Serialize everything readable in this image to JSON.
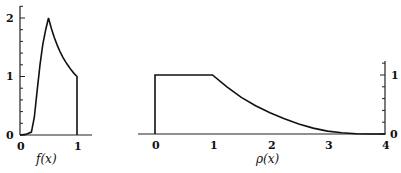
{
  "chart_data": [
    {
      "type": "line",
      "title": "",
      "xlabel": "f(x)",
      "ylabel": "",
      "xlim": [
        0,
        1.2
      ],
      "ylim": [
        0,
        2.2
      ],
      "grid": false,
      "legend": null,
      "y_axis_position": "left",
      "x_ticks": [
        0,
        1
      ],
      "x_tick_labels": [
        "0",
        "1"
      ],
      "y_ticks": [
        0,
        1,
        2
      ],
      "y_tick_labels": [
        "0",
        "1",
        "2"
      ],
      "y_minor_tick_step": 0.2,
      "series": [
        {
          "name": "f(x)",
          "x": [
            0,
            0.1,
            0.2,
            0.25,
            0.3,
            0.35,
            0.4,
            0.45,
            0.5,
            0.55,
            0.6,
            0.65,
            0.7,
            0.75,
            0.8,
            0.85,
            0.9,
            0.95,
            1.0,
            1.0
          ],
          "values": [
            0,
            0.01,
            0.05,
            0.3,
            0.75,
            1.2,
            1.55,
            1.8,
            2.0,
            1.82,
            1.67,
            1.54,
            1.43,
            1.33,
            1.25,
            1.18,
            1.11,
            1.05,
            1.0,
            0
          ]
        }
      ]
    },
    {
      "type": "line",
      "title": "",
      "xlabel": "ρ(x)",
      "ylabel": "",
      "xlim": [
        -0.25,
        4
      ],
      "ylim": [
        0,
        1.2
      ],
      "grid": false,
      "legend": null,
      "y_axis_position": "right",
      "x_ticks": [
        0,
        1,
        2,
        3,
        4
      ],
      "x_tick_labels": [
        "0",
        "1",
        "2",
        "3",
        "4"
      ],
      "y_ticks": [
        0,
        1
      ],
      "y_tick_labels": [
        "0",
        "1"
      ],
      "y_minor_tick_step": 0.2,
      "series": [
        {
          "name": "ρ(x)",
          "x": [
            0,
            0,
            1,
            1.25,
            1.5,
            1.75,
            2.0,
            2.25,
            2.5,
            2.75,
            3.0,
            3.25,
            3.5,
            3.75,
            4.0
          ],
          "values": [
            0,
            1,
            1,
            0.8,
            0.62,
            0.48,
            0.36,
            0.26,
            0.17,
            0.1,
            0.05,
            0.02,
            0.005,
            0.0,
            0.0
          ]
        }
      ]
    }
  ],
  "left_plot": {
    "xlabel": "f(x)",
    "x_tick_labels": [
      "0",
      "1"
    ],
    "y_tick_labels": [
      "0",
      "1",
      "2"
    ]
  },
  "right_plot": {
    "xlabel": "ρ(x)",
    "x_tick_labels": [
      "0",
      "1",
      "2",
      "3",
      "4"
    ],
    "y_tick_labels": [
      "0",
      "1"
    ]
  },
  "colors": {
    "line": "#111111",
    "axis": "#222222",
    "background": "#ffffff"
  }
}
